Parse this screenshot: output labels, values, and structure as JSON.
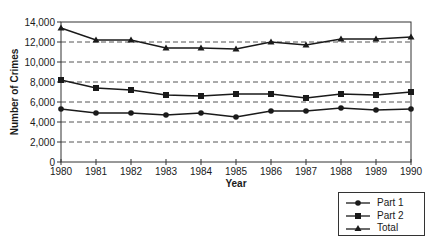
{
  "chart_data": {
    "type": "line",
    "title": "",
    "xlabel": "Year",
    "ylabel": "Number of Crimes",
    "x": [
      "1980",
      "1981",
      "1982",
      "1983",
      "1984",
      "1985",
      "1986",
      "1987",
      "1988",
      "1989",
      "1990"
    ],
    "ylim": [
      0,
      14000
    ],
    "yticks": [
      0,
      2000,
      4000,
      6000,
      8000,
      10000,
      12000,
      14000
    ],
    "ytick_labels": [
      "0",
      "2,000",
      "4,000",
      "6,000",
      "8,000",
      "10,000",
      "12,000",
      "14,000"
    ],
    "grid": "horizontal dashed",
    "legend_position": "bottom-right, outside plot",
    "series": [
      {
        "name": "Part 1",
        "marker": "circle",
        "values": [
          5300,
          4900,
          4900,
          4700,
          4900,
          4500,
          5100,
          5100,
          5400,
          5200,
          5300
        ]
      },
      {
        "name": "Part 2",
        "marker": "square",
        "values": [
          8200,
          7400,
          7200,
          6700,
          6600,
          6800,
          6800,
          6400,
          6800,
          6700,
          7000
        ]
      },
      {
        "name": "Total",
        "marker": "triangle",
        "values": [
          13400,
          12200,
          12200,
          11400,
          11400,
          11300,
          12000,
          11700,
          12300,
          12300,
          12500
        ]
      }
    ]
  },
  "legend": {
    "items": [
      {
        "label": "Part 1",
        "marker": "circle"
      },
      {
        "label": "Part 2",
        "marker": "square"
      },
      {
        "label": "Total",
        "marker": "triangle"
      }
    ]
  },
  "colors": {
    "line": "#1a1a1a",
    "grid": "#555555",
    "frame": "#333333"
  }
}
